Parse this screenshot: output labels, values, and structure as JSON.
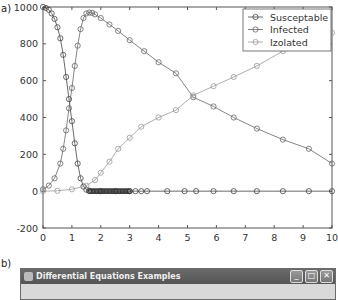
{
  "panels": {
    "a_label": "a)",
    "b_label": "b)"
  },
  "chart_data": {
    "type": "line",
    "title": "",
    "xlabel": "",
    "ylabel": "",
    "xlim": [
      0,
      10
    ],
    "ylim": [
      -200,
      1000
    ],
    "x_ticks": [
      "0",
      "1",
      "2",
      "3",
      "4",
      "5",
      "6",
      "7",
      "8",
      "9",
      "10"
    ],
    "y_ticks": [
      "-200",
      "0",
      "200",
      "400",
      "600",
      "800",
      "1000"
    ],
    "grid": false,
    "legend_position": "upper right",
    "series": [
      {
        "name": "Susceptable",
        "color": "#444444",
        "x": [
          0,
          0.1,
          0.2,
          0.3,
          0.4,
          0.5,
          0.6,
          0.7,
          0.8,
          0.9,
          1.0,
          1.1,
          1.2,
          1.3,
          1.4,
          1.5,
          1.6,
          2.0,
          2.5,
          3.0,
          3.2,
          3.4,
          3.6,
          4.3,
          4.9,
          5.3,
          5.9,
          6.6,
          7.4,
          8.3,
          9.2,
          10
        ],
        "y": [
          1000,
          995,
          985,
          965,
          935,
          890,
          830,
          740,
          620,
          500,
          380,
          260,
          150,
          70,
          25,
          8,
          2,
          0,
          0,
          0,
          0,
          0,
          0,
          0,
          0,
          0,
          0,
          0,
          0,
          0,
          0,
          0
        ]
      },
      {
        "name": "Infected",
        "color": "#666666",
        "x": [
          0,
          0.2,
          0.4,
          0.6,
          0.7,
          0.8,
          0.9,
          1.0,
          1.1,
          1.2,
          1.3,
          1.4,
          1.5,
          1.6,
          1.7,
          1.8,
          2.0,
          2.3,
          2.6,
          3.0,
          3.5,
          4.0,
          4.6,
          5.2,
          5.9,
          6.6,
          7.4,
          8.3,
          9.2,
          10
        ],
        "y": [
          10,
          30,
          70,
          150,
          230,
          330,
          450,
          560,
          680,
          790,
          880,
          940,
          965,
          970,
          968,
          960,
          940,
          905,
          870,
          820,
          760,
          700,
          640,
          510,
          460,
          400,
          340,
          280,
          230,
          150
        ]
      },
      {
        "name": "Izolated",
        "color": "#999999",
        "x": [
          0,
          0.5,
          1.0,
          1.5,
          1.8,
          2.0,
          2.3,
          2.6,
          3.0,
          3.4,
          4.0,
          4.6,
          5.2,
          5.9,
          6.6,
          7.4,
          8.3,
          9.2,
          10
        ],
        "y": [
          0,
          2,
          10,
          30,
          60,
          100,
          160,
          230,
          290,
          350,
          400,
          440,
          520,
          570,
          620,
          680,
          760,
          820,
          860
        ]
      }
    ]
  },
  "window": {
    "title": "Differential Equations Examples",
    "buttons": {
      "minimize": "_",
      "maximize": "□",
      "close": "✕"
    }
  }
}
